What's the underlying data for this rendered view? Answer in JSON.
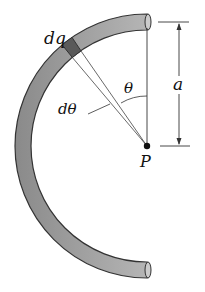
{
  "diagram": {
    "labels": {
      "dq": "dq",
      "theta": "θ",
      "dtheta": "dθ",
      "a": "a",
      "P": "P"
    },
    "colors": {
      "rod_fill": "#9a9a9a",
      "rod_outline": "#333333",
      "element_fill": "#555555",
      "lines": "#333333"
    }
  }
}
